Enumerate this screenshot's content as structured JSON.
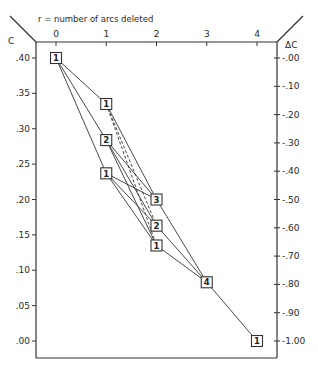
{
  "chart_data": {
    "type": "line",
    "title": "r = number of arcs deleted",
    "xlabel": "r = number of arcs deleted",
    "ylabel": "C",
    "ylabel_right": "ΔC",
    "x_ticks": [
      "0",
      "1",
      "2",
      "3",
      "4"
    ],
    "y_ticks": [
      ".40",
      ".35",
      ".30",
      ".25",
      ".20",
      ".15",
      ".10",
      ".05",
      ".00"
    ],
    "y_ticks_right": [
      "-.00",
      "-.10",
      "-.20",
      "-.30",
      "-.40",
      "-.50",
      "-.60",
      "-.70",
      "-.80",
      "-.90",
      "-1.00"
    ],
    "xlim": [
      0,
      4
    ],
    "ylim": [
      0.0,
      0.4
    ],
    "ylim_right": [
      -1.0,
      0.0
    ],
    "grid": false,
    "nodes": [
      {
        "id": "a",
        "r": 0,
        "C": 0.4,
        "label": "1"
      },
      {
        "id": "b",
        "r": 1,
        "C": 0.335,
        "label": "1"
      },
      {
        "id": "c",
        "r": 1,
        "C": 0.284,
        "label": "2"
      },
      {
        "id": "d",
        "r": 1,
        "C": 0.237,
        "label": "1"
      },
      {
        "id": "e",
        "r": 2,
        "C": 0.2,
        "label": "3"
      },
      {
        "id": "f",
        "r": 2,
        "C": 0.163,
        "label": "2"
      },
      {
        "id": "g",
        "r": 2,
        "C": 0.135,
        "label": "1"
      },
      {
        "id": "h",
        "r": 3,
        "C": 0.083,
        "label": "4"
      },
      {
        "id": "i",
        "r": 4,
        "C": 0.0,
        "label": "1"
      }
    ],
    "edges": [
      {
        "from": "a",
        "to": "b",
        "style": "solid"
      },
      {
        "from": "a",
        "to": "c",
        "style": "solid"
      },
      {
        "from": "a",
        "to": "d",
        "style": "solid"
      },
      {
        "from": "b",
        "to": "e",
        "style": "solid"
      },
      {
        "from": "b",
        "to": "f",
        "style": "dashed"
      },
      {
        "from": "b",
        "to": "g",
        "style": "dashed"
      },
      {
        "from": "c",
        "to": "e",
        "style": "solid"
      },
      {
        "from": "c",
        "to": "f",
        "style": "solid"
      },
      {
        "from": "c",
        "to": "g",
        "style": "solid"
      },
      {
        "from": "d",
        "to": "e",
        "style": "solid"
      },
      {
        "from": "d",
        "to": "f",
        "style": "solid"
      },
      {
        "from": "d",
        "to": "g",
        "style": "solid"
      },
      {
        "from": "e",
        "to": "h",
        "style": "solid"
      },
      {
        "from": "f",
        "to": "h",
        "style": "solid"
      },
      {
        "from": "g",
        "to": "h",
        "style": "solid"
      },
      {
        "from": "h",
        "to": "i",
        "style": "solid"
      }
    ]
  },
  "labels": {
    "title": "r = number of arcs deleted",
    "left_axis": "C",
    "right_axis": "ΔC"
  }
}
